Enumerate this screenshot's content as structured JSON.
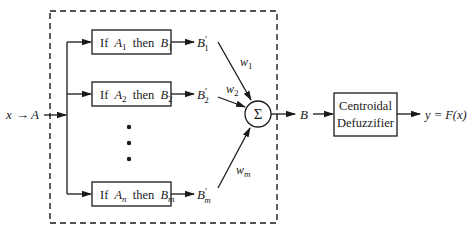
{
  "diagram": {
    "input": {
      "label_x": "x",
      "arrow": "→",
      "label_A": "A"
    },
    "rules": [
      {
        "if": "If",
        "A": "A",
        "A_sub": "1",
        "then": "then",
        "B": "B",
        "B_sub": "1",
        "output": "B",
        "output_prime": "′",
        "output_sub": "1",
        "weight": "w",
        "weight_sub": "1"
      },
      {
        "if": "If",
        "A": "A",
        "A_sub": "2",
        "then": "then",
        "B": "B",
        "B_sub": "2",
        "output": "B",
        "output_prime": "′",
        "output_sub": "2",
        "weight": "w",
        "weight_sub": "2"
      },
      {
        "if": "If",
        "A": "A",
        "A_sub": "n",
        "then": "then",
        "B": "B",
        "B_sub": "m",
        "output": "B",
        "output_prime": "′",
        "output_sub": "m",
        "weight": "w",
        "weight_sub": "m"
      }
    ],
    "ellipsis": "⋮",
    "sum_symbol": "Σ",
    "sum_output": "B",
    "defuzzifier": {
      "line1": "Centroidal",
      "line2": "Defuzzifier"
    },
    "output": {
      "label": "y = F(x)"
    },
    "colors": {
      "stroke": "#1a1a1a",
      "background": "#ffffff"
    }
  }
}
